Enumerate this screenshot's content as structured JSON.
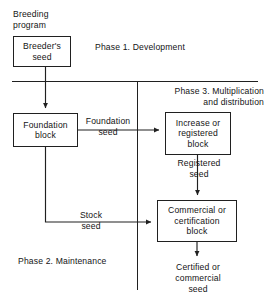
{
  "diagram": {
    "type": "flowchart",
    "stroke_color": "#202020",
    "background_color": "#ffffff",
    "nodes": [
      {
        "id": "breeder",
        "label": "Breeder's\nseed"
      },
      {
        "id": "foundation",
        "label": "Foundation\nblock"
      },
      {
        "id": "increase",
        "label": "Increase or\nregistered\nblock"
      },
      {
        "id": "commercial",
        "label": "Commercial or\ncertification\nblock"
      }
    ],
    "labels": {
      "breeding_program": "Breeding\nprogram",
      "phase1": "Phase 1. Development",
      "phase2": "Phase 2. Maintenance",
      "phase3": "Phase 3. Multiplication\nand distribution",
      "foundation_seed": "Foundation\nseed",
      "registered_seed": "Registered\nseed",
      "stock_seed": "Stock\nseed",
      "certified_seed": "Certified or\ncommercial\nseed"
    },
    "edges": [
      {
        "from": "breeder",
        "to": "foundation",
        "label": ""
      },
      {
        "from": "foundation",
        "to": "increase",
        "label": "Foundation seed"
      },
      {
        "from": "increase",
        "to": "commercial",
        "label": "Registered seed"
      },
      {
        "from": "foundation",
        "to": "commercial",
        "label": "Stock seed"
      },
      {
        "from": "commercial",
        "to": "certified_seed_output",
        "label": "Certified or commercial seed"
      }
    ],
    "dividers": [
      {
        "orientation": "horizontal",
        "note": "separates Phase 1 from Phases 2 and 3"
      },
      {
        "orientation": "vertical",
        "note": "separates Phase 2 from Phase 3"
      }
    ]
  }
}
